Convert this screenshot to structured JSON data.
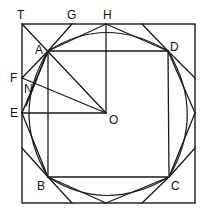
{
  "diagram": {
    "title": "",
    "colors": {
      "stroke": "#1a1a1a",
      "background": "#ffffff",
      "text": "#111111"
    },
    "labels": {
      "T": "T",
      "G": "G",
      "H": "H",
      "A": "A",
      "D": "D",
      "F": "F",
      "N": "N",
      "E": "E",
      "O": "O",
      "B": "B",
      "C": "C"
    },
    "points": {
      "T": [
        22,
        24
      ],
      "G": [
        72,
        24
      ],
      "H": [
        106,
        24
      ],
      "A": [
        48,
        51
      ],
      "D": [
        168,
        51
      ],
      "F": [
        22,
        78
      ],
      "N": [
        30,
        86
      ],
      "E": [
        22,
        113
      ],
      "O": [
        106,
        113
      ],
      "B": [
        48,
        177
      ],
      "C": [
        169,
        177
      ]
    }
  }
}
